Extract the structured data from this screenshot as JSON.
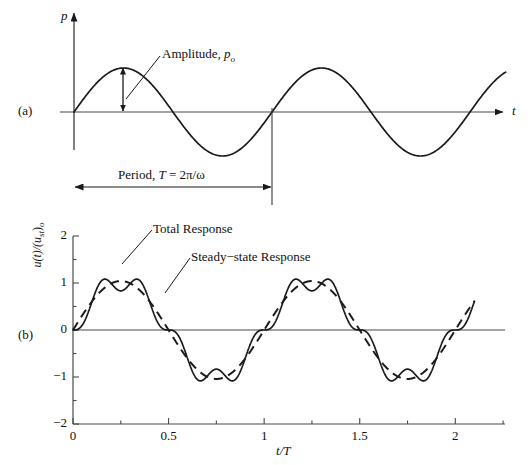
{
  "figure": {
    "panels": [
      {
        "tag": "(a)",
        "description": "Harmonic excitation p(t) versus time",
        "yaxis_label": "p",
        "xaxis_label": "t",
        "annotations": [
          {
            "name": "amplitude",
            "text_main": "Amplitude, ",
            "text_sym": "p",
            "text_sub": "o"
          },
          {
            "name": "period",
            "text_main": "Period, ",
            "text_sym": "T",
            "text_eq": " = 2π/ω"
          }
        ]
      },
      {
        "tag": "(b)",
        "description": "Normalized response versus normalized time",
        "yaxis_label_parts": {
          "u_of_t": "u(t)/(u",
          "sub_st": "st",
          "close": ")",
          "sub_o": "o"
        },
        "xaxis_label_parts": {
          "t": "t",
          "slash": "/",
          "T": "T"
        },
        "annotations": [
          {
            "name": "total-response",
            "text": "Total Response"
          },
          {
            "name": "steady-state-response",
            "text": "Steady−state Response"
          }
        ]
      }
    ]
  },
  "chart_data": [
    {
      "type": "line",
      "panel": "(a)",
      "title": "Harmonic force p(t)",
      "xlabel": "t",
      "ylabel": "p",
      "series": [
        {
          "name": "p(t) = p_o sin(omega t)",
          "style": "solid",
          "formula": "p_o * sin(2*pi*t/T)",
          "amplitude": 1.0,
          "period": 1.0,
          "x_start": 0.0,
          "x_end": 2.18
        }
      ],
      "annotations": [
        {
          "label": "Amplitude, p_o",
          "points_to": "peak at t/T = 0.25",
          "value": 1.0
        },
        {
          "label": "Period, T = 2π/ω",
          "span_from": 0.0,
          "span_to": 1.0
        }
      ],
      "grid": false,
      "axis_style": "arrow-axes-no-ticks"
    },
    {
      "type": "line",
      "panel": "(b)",
      "title": "Total response vs steady-state response",
      "xlabel": "t/T",
      "ylabel": "u(t)/(u_st)_o",
      "xlim": [
        0,
        2.26
      ],
      "ylim": [
        -2.3,
        2.3
      ],
      "xticks": [
        0,
        0.5,
        1,
        1.5,
        2
      ],
      "xtick_labels": [
        "0",
        "0.5",
        "1",
        "1.5",
        "2"
      ],
      "xminor_ticks": [
        0.25,
        0.75,
        1.25,
        1.75,
        2.25
      ],
      "yticks": [
        -2,
        -1,
        0,
        1,
        2
      ],
      "ytick_labels": [
        "−2",
        "−1",
        "0",
        "1",
        "2"
      ],
      "yminor_ticks": [
        -1.5,
        -0.5,
        0.5,
        1.5
      ],
      "grid": false,
      "frequency_ratio": 0.2,
      "damping_ratio": 0.0,
      "series": [
        {
          "name": "Total Response",
          "style": "solid",
          "formula": "(1/(1-r^2)) * ( sin(2*pi*t) - r*sin(2*pi*t/r) )",
          "r": 0.2,
          "x_start": 0.0,
          "x_end": 2.1,
          "peak_value": 2.0,
          "trough_value": -2.0
        },
        {
          "name": "Steady-state Response",
          "style": "dashed",
          "formula": "(1/(1-r^2)) * sin(2*pi*t)",
          "r": 0.2,
          "x_start": 0.0,
          "x_end": 2.1,
          "peak_value": 1.042,
          "trough_value": -1.042
        }
      ],
      "annotations": [
        {
          "label": "Total Response",
          "points_to": "solid curve near t/T = 0.26"
        },
        {
          "label": "Steady−state Response",
          "points_to": "dashed curve near t/T = 0.47"
        }
      ]
    }
  ]
}
